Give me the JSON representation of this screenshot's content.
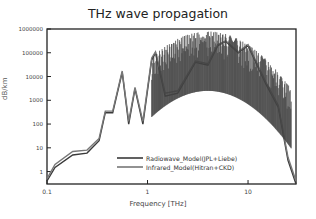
{
  "chart_data": {
    "type": "line",
    "title": "THz wave propagation",
    "xlabel": "Frequency [THz]",
    "ylabel": "dB/km",
    "xscale": "log",
    "yscale": "log",
    "xlim": [
      0.1,
      30
    ],
    "ylim": [
      0.3,
      1000000
    ],
    "x_ticks": [
      "0.1",
      "1",
      "10"
    ],
    "y_ticks": [
      "1",
      "10",
      "100",
      "1000",
      "10000",
      "100000",
      "1000000"
    ],
    "grid": false,
    "legend_position": "lower center",
    "series": [
      {
        "name": "Radiowave_Model(JPL+Liebe)",
        "color": "#3a3a3a",
        "x": [
          0.1,
          0.12,
          0.18,
          0.25,
          0.33,
          0.38,
          0.45,
          0.56,
          0.65,
          0.75,
          0.9,
          1.1,
          1.2,
          1.5,
          2,
          3,
          4,
          5,
          6,
          8,
          10,
          15,
          20,
          25,
          30
        ],
        "y": [
          0.4,
          1.5,
          5,
          6,
          20,
          300,
          300,
          15000,
          100,
          3000,
          100,
          50000,
          100000,
          1500,
          2000,
          40000,
          30000,
          200000,
          300000,
          100000,
          200000,
          5000,
          500,
          3,
          0.3
        ]
      },
      {
        "name": "Infrared_Model(Hitran+CKD)",
        "color": "#777777",
        "x": [
          0.1,
          0.12,
          0.18,
          0.25,
          0.33,
          0.38,
          0.45,
          0.56,
          0.65,
          0.75,
          0.9,
          1.1,
          1.2,
          1.5,
          2,
          3,
          4,
          5,
          6,
          8,
          10,
          15,
          20,
          25,
          30
        ],
        "y": [
          0.5,
          2,
          7,
          8,
          25,
          350,
          350,
          17000,
          130,
          3500,
          130,
          60000,
          110000,
          2000,
          2500,
          45000,
          35000,
          220000,
          320000,
          110000,
          220000,
          6000,
          600,
          4,
          0.4
        ]
      }
    ]
  }
}
